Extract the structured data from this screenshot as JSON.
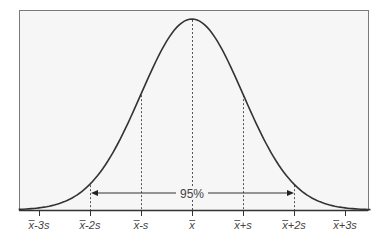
{
  "chart_data": {
    "type": "line",
    "title": "",
    "subtitle": "",
    "xlabel": "",
    "ylabel": "",
    "x_ticks": [
      -3,
      -2,
      -1,
      0,
      1,
      2,
      3
    ],
    "tick_labels": [
      "x̄-3s",
      "x̄-2s",
      "x̄-s",
      "x̄",
      "x̄+s",
      "x̄+2s",
      "x̄+3s"
    ],
    "series": [
      {
        "name": "normal density",
        "x": [
          -3,
          -2.5,
          -2,
          -1.5,
          -1,
          -0.5,
          0,
          0.5,
          1,
          1.5,
          2,
          2.5,
          3
        ],
        "values": [
          0.011,
          0.044,
          0.135,
          0.325,
          0.607,
          0.882,
          1.0,
          0.882,
          0.607,
          0.325,
          0.135,
          0.044,
          0.011
        ]
      }
    ],
    "reference_lines": [
      {
        "x": -2,
        "style": "dashed"
      },
      {
        "x": -1,
        "style": "dashed"
      },
      {
        "x": 0,
        "style": "dashed"
      },
      {
        "x": 1,
        "style": "dashed"
      },
      {
        "x": 2,
        "style": "dashed"
      }
    ],
    "annotations": [
      {
        "text": "95%",
        "type": "double-arrow",
        "from": -2,
        "to": 2
      }
    ],
    "xlim": [
      -3.4,
      3.5
    ],
    "ylim": [
      0,
      1.0
    ],
    "grid": false,
    "legend": "none"
  },
  "colors": {
    "plot_background": "#f6f6f6",
    "frame": "#7a7a7a",
    "curve": "#333333",
    "reference": "#555555",
    "text": "#444444"
  },
  "annotation_label": "95%",
  "labels": {
    "m3": {
      "base": "x",
      "suffix": "-3s"
    },
    "m2": {
      "base": "x",
      "suffix": "-2s"
    },
    "m1": {
      "base": "x",
      "suffix": "-s"
    },
    "mean": {
      "base": "x",
      "suffix": ""
    },
    "p1": {
      "base": "x",
      "suffix": "+s"
    },
    "p2": {
      "base": "x",
      "suffix": "+2s"
    },
    "p3": {
      "base": "x",
      "suffix": "+3s"
    }
  }
}
